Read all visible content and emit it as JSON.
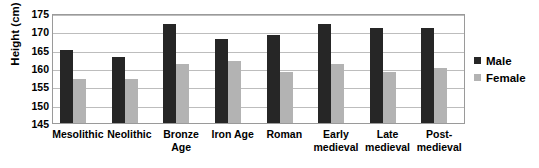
{
  "chart_data": {
    "type": "bar",
    "title": "",
    "xlabel": "",
    "ylabel": "Height (cm)",
    "ylim": [
      145,
      175
    ],
    "ytick_step": 5,
    "yticks": [
      175,
      170,
      165,
      160,
      155,
      150,
      145
    ],
    "grid": true,
    "legend_position": "right",
    "categories": [
      "Mesolithic",
      "Neolithic",
      "Bronze Age",
      "Iron Age",
      "Roman",
      "Early medieval",
      "Late medieval",
      "Post-medieval"
    ],
    "category_lines": [
      [
        "Mesolithic"
      ],
      [
        "Neolithic"
      ],
      [
        "Bronze",
        "Age"
      ],
      [
        "Iron Age"
      ],
      [
        "Roman"
      ],
      [
        "Early",
        "medieval"
      ],
      [
        "Late",
        "medieval"
      ],
      [
        "Post-",
        "medieval"
      ]
    ],
    "series": [
      {
        "name": "Male",
        "color": "#262626",
        "values": [
          165,
          163,
          172,
          168,
          169,
          172,
          171,
          171
        ]
      },
      {
        "name": "Female",
        "color": "#b3b3b3",
        "values": [
          157,
          157,
          161,
          162,
          159,
          161,
          159,
          160
        ]
      }
    ]
  },
  "legend": {
    "items": [
      {
        "label": "Male",
        "color": "#262626"
      },
      {
        "label": "Female",
        "color": "#b3b3b3"
      }
    ]
  },
  "axis": {
    "y_title": "Height (cm)"
  },
  "colors": {
    "male": "#262626",
    "female": "#b3b3b3",
    "gridline": "#bdbdbd",
    "plot_border": "#9a9a9a",
    "background": "#ffffff",
    "text": "#000000"
  }
}
